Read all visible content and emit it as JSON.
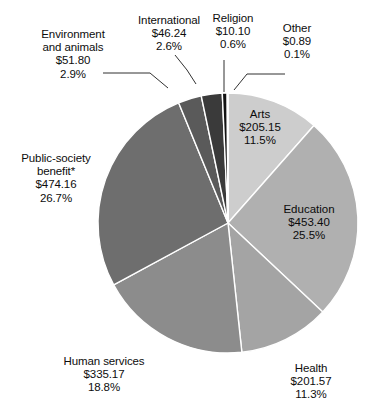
{
  "chart_data": {
    "type": "pie",
    "title": "",
    "subtitle": "",
    "xlabel": "",
    "ylabel": "",
    "legend_position": "none",
    "grid": false,
    "value_prefix": "$",
    "units": "billions of dollars",
    "categories": [
      "Arts",
      "Education",
      "Health",
      "Human services",
      "Public-society benefit*",
      "Environment and animals",
      "International",
      "Religion",
      "Other"
    ],
    "values": [
      205.15,
      453.4,
      201.57,
      335.17,
      474.16,
      51.8,
      46.24,
      10.1,
      0.89
    ],
    "percents": [
      11.5,
      25.5,
      11.3,
      18.8,
      26.7,
      2.9,
      2.6,
      0.6,
      0.1
    ],
    "colors": [
      "#cdcdcd",
      "#b0b0b0",
      "#a4a4a4",
      "#8c8c8c",
      "#6e6e6e",
      "#5a5a5a",
      "#3a3a3a",
      "#121212",
      "#d6d6d6"
    ],
    "slice_separator_color": "#ffffff",
    "start_angle_deg": 0,
    "direction": "clockwise",
    "slices": [
      {
        "name": "Arts",
        "label_lines": [
          "Arts",
          "$205.15",
          "11.5%"
        ],
        "value": 205.15,
        "percent": 11.5,
        "color": "#cdcdcd",
        "label_placement": "inside"
      },
      {
        "name": "Education",
        "label_lines": [
          "Education",
          "$453.40",
          "25.5%"
        ],
        "value": 453.4,
        "percent": 25.5,
        "color": "#b0b0b0",
        "label_placement": "inside"
      },
      {
        "name": "Health",
        "label_lines": [
          "Health",
          "$201.57",
          "11.3%"
        ],
        "value": 201.57,
        "percent": 11.3,
        "color": "#a4a4a4",
        "label_placement": "outside"
      },
      {
        "name": "Human services",
        "label_lines": [
          "Human services",
          "$335.17",
          "18.8%"
        ],
        "value": 335.17,
        "percent": 18.8,
        "color": "#8c8c8c",
        "label_placement": "outside"
      },
      {
        "name": "Public-society benefit*",
        "label_lines": [
          "Public-society",
          "benefit*",
          "$474.16",
          "26.7%"
        ],
        "value": 474.16,
        "percent": 26.7,
        "color": "#6e6e6e",
        "label_placement": "outside"
      },
      {
        "name": "Environment and animals",
        "label_lines": [
          "Environment",
          "and animals",
          "$51.80",
          "2.9%"
        ],
        "value": 51.8,
        "percent": 2.9,
        "color": "#5a5a5a",
        "label_placement": "outside-leader"
      },
      {
        "name": "International",
        "label_lines": [
          "International",
          "$46.24",
          "2.6%"
        ],
        "value": 46.24,
        "percent": 2.6,
        "color": "#3a3a3a",
        "label_placement": "outside-leader"
      },
      {
        "name": "Religion",
        "label_lines": [
          "Religion",
          "$10.10",
          "0.6%"
        ],
        "value": 10.1,
        "percent": 0.6,
        "color": "#121212",
        "label_placement": "outside-leader"
      },
      {
        "name": "Other",
        "label_lines": [
          "Other",
          "$0.89",
          "0.1%"
        ],
        "value": 0.89,
        "percent": 0.1,
        "color": "#d6d6d6",
        "label_placement": "outside-leader"
      }
    ]
  },
  "labels": {
    "arts": {
      "l1": "Arts",
      "l2": "$205.15",
      "l3": "11.5%"
    },
    "education": {
      "l1": "Education",
      "l2": "$453.40",
      "l3": "25.5%"
    },
    "health": {
      "l1": "Health",
      "l2": "$201.57",
      "l3": "11.3%"
    },
    "human_services": {
      "l1": "Human services",
      "l2": "$335.17",
      "l3": "18.8%"
    },
    "public_society": {
      "l1": "Public-society",
      "l2": "benefit*",
      "l3": "$474.16",
      "l4": "26.7%"
    },
    "environment": {
      "l1": "Environment",
      "l2": "and animals",
      "l3": "$51.80",
      "l4": "2.9%"
    },
    "international": {
      "l1": "International",
      "l2": "$46.24",
      "l3": "2.6%"
    },
    "religion": {
      "l1": "Religion",
      "l2": "$10.10",
      "l3": "0.6%"
    },
    "other": {
      "l1": "Other",
      "l2": "$0.89",
      "l3": "0.1%"
    }
  }
}
